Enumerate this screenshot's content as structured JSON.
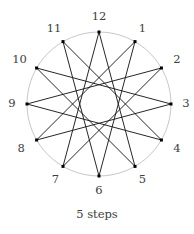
{
  "figure": {
    "title": "",
    "caption": "5 steps",
    "background_color": "#ffffff"
  },
  "chart_data": {
    "type": "diagram",
    "subtype": "star-polygon",
    "title": "5 steps",
    "notation": "{12/5}",
    "num_points": 12,
    "step": 5,
    "xlabel": "",
    "ylabel": "",
    "legend": [],
    "grid": false,
    "circle": {
      "center_x": 99,
      "center_y": 104,
      "outer_radius": 72,
      "inner_hole_radius": 18.6,
      "stroke_color": "#b9b9b9",
      "stroke_width": 0.8,
      "fill": "none"
    },
    "style": {
      "chord_color": "#1b1b1b",
      "chord_width": 0.95,
      "vertex_color": "#000000",
      "vertex_size": 3.0,
      "label_color": "#3d3d3d",
      "label_font_size": 11.5,
      "label_radius_offset": 15
    },
    "points": [
      {
        "label": "1",
        "index": 1,
        "angle_deg": 60,
        "x": 135.0,
        "y": 41.6,
        "label_x": 142.5,
        "label_y": 28.5
      },
      {
        "label": "2",
        "index": 2,
        "angle_deg": 30,
        "x": 161.4,
        "y": 68.0,
        "label_x": 176.9,
        "label_y": 59.5
      },
      {
        "label": "3",
        "index": 3,
        "angle_deg": 0,
        "x": 171.0,
        "y": 104.0,
        "label_x": 186.0,
        "label_y": 104.0
      },
      {
        "label": "4",
        "index": 4,
        "angle_deg": -30,
        "x": 161.4,
        "y": 140.0,
        "label_x": 176.9,
        "label_y": 148.5
      },
      {
        "label": "5",
        "index": 5,
        "angle_deg": -60,
        "x": 135.0,
        "y": 166.4,
        "label_x": 142.5,
        "label_y": 179.5
      },
      {
        "label": "6",
        "index": 6,
        "angle_deg": -90,
        "x": 99.0,
        "y": 176.0,
        "label_x": 99.0,
        "label_y": 191.0
      },
      {
        "label": "7",
        "index": 7,
        "angle_deg": -120,
        "x": 63.0,
        "y": 166.4,
        "label_x": 55.5,
        "label_y": 179.5
      },
      {
        "label": "8",
        "index": 8,
        "angle_deg": -150,
        "x": 36.6,
        "y": 140.0,
        "label_x": 21.1,
        "label_y": 148.5
      },
      {
        "label": "9",
        "index": 9,
        "angle_deg": 180,
        "x": 27.0,
        "y": 104.0,
        "label_x": 12.0,
        "label_y": 104.0
      },
      {
        "label": "10",
        "index": 10,
        "angle_deg": 150,
        "x": 36.6,
        "y": 68.0,
        "label_x": 19.6,
        "label_y": 59.5
      },
      {
        "label": "11",
        "index": 11,
        "angle_deg": 120,
        "x": 63.0,
        "y": 41.6,
        "label_x": 54.0,
        "label_y": 28.5
      },
      {
        "label": "12",
        "index": 12,
        "angle_deg": 90,
        "x": 99.0,
        "y": 32.0,
        "label_x": 99.0,
        "label_y": 17.0
      }
    ],
    "chords": [
      {
        "from": "12",
        "to": "5"
      },
      {
        "from": "5",
        "to": "10"
      },
      {
        "from": "10",
        "to": "3"
      },
      {
        "from": "3",
        "to": "8"
      },
      {
        "from": "8",
        "to": "1"
      },
      {
        "from": "1",
        "to": "6"
      },
      {
        "from": "6",
        "to": "11"
      },
      {
        "from": "11",
        "to": "4"
      },
      {
        "from": "4",
        "to": "9"
      },
      {
        "from": "9",
        "to": "2"
      },
      {
        "from": "2",
        "to": "7"
      },
      {
        "from": "7",
        "to": "12"
      }
    ]
  }
}
